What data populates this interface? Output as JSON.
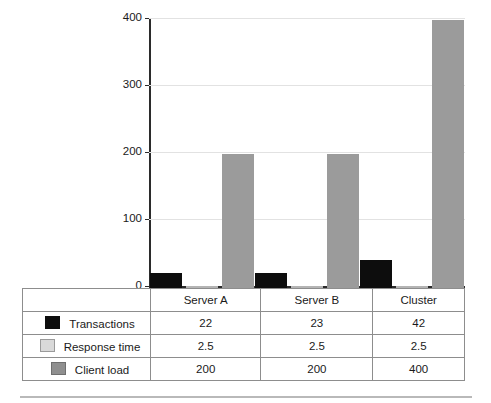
{
  "chart_data": {
    "type": "bar",
    "title": "",
    "xlabel": "",
    "ylabel": "",
    "ylim": [
      0,
      400
    ],
    "yticks": [
      0,
      100,
      200,
      300,
      400
    ],
    "ytick_labels": [
      "0",
      "100",
      "200",
      "300",
      "400"
    ],
    "grid": true,
    "legend_position": "bottom-table",
    "categories": [
      "Server A",
      "Server B",
      "Cluster"
    ],
    "series": [
      {
        "name": "Transactions",
        "color": "#0d0d0d",
        "values": [
          22,
          23,
          42
        ]
      },
      {
        "name": "Response time",
        "color": "#d9d9d9",
        "values": [
          2.5,
          2.5,
          2.5
        ]
      },
      {
        "name": "Client load",
        "color": "#9b9b9b",
        "values": [
          200,
          200,
          400
        ]
      }
    ]
  },
  "axis": {
    "tick_400": "400",
    "tick_300": "300",
    "tick_200": "200",
    "tick_100": "100",
    "tick_0": "0"
  },
  "table": {
    "column_headers": [
      "Server A",
      "Server B",
      "Cluster"
    ],
    "rows": [
      {
        "label": "Transactions",
        "swatch": "black-square-icon",
        "cells": [
          "22",
          "23",
          "42"
        ]
      },
      {
        "label": "Response time",
        "swatch": "light-gray-square-icon",
        "cells": [
          "2.5",
          "2.5",
          "2.5"
        ]
      },
      {
        "label": "Client load",
        "swatch": "gray-square-icon",
        "cells": [
          "200",
          "200",
          "400"
        ]
      }
    ]
  }
}
